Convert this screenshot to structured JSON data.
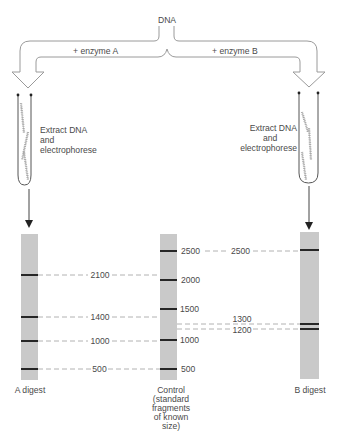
{
  "diagram": {
    "source_label": "DNA",
    "branches": [
      {
        "label": "+ enzyme A"
      },
      {
        "label": "+ enzyme B"
      }
    ],
    "tube_caption_left": [
      "Extract DNA",
      "and",
      "electrophorese"
    ],
    "tube_caption_right": [
      "Extract DNA",
      "and",
      "electrophorese"
    ]
  },
  "lanes": {
    "a": {
      "label": "A digest",
      "band_sizes": [
        2100,
        1400,
        1000,
        500
      ],
      "band_labels": [
        "2100",
        "1400",
        "1000",
        "500"
      ]
    },
    "control": {
      "label_lines": [
        "Control",
        "(standard",
        "fragments",
        "of known",
        "size)"
      ],
      "band_sizes": [
        2500,
        2000,
        1500,
        1000,
        500
      ],
      "band_labels": [
        "2500",
        "2000",
        "1500",
        "1000",
        "500"
      ]
    },
    "b": {
      "label": "B digest",
      "band_sizes": [
        2500,
        1300,
        1200
      ],
      "band_labels": [
        "2500",
        "1300",
        "1200"
      ]
    }
  },
  "colors": {
    "lane": "#c9c9c9",
    "band": "#262626",
    "guide_dash": "#a0a0a0",
    "outline": "#9a9a9a",
    "text": "#4a4a4a"
  }
}
